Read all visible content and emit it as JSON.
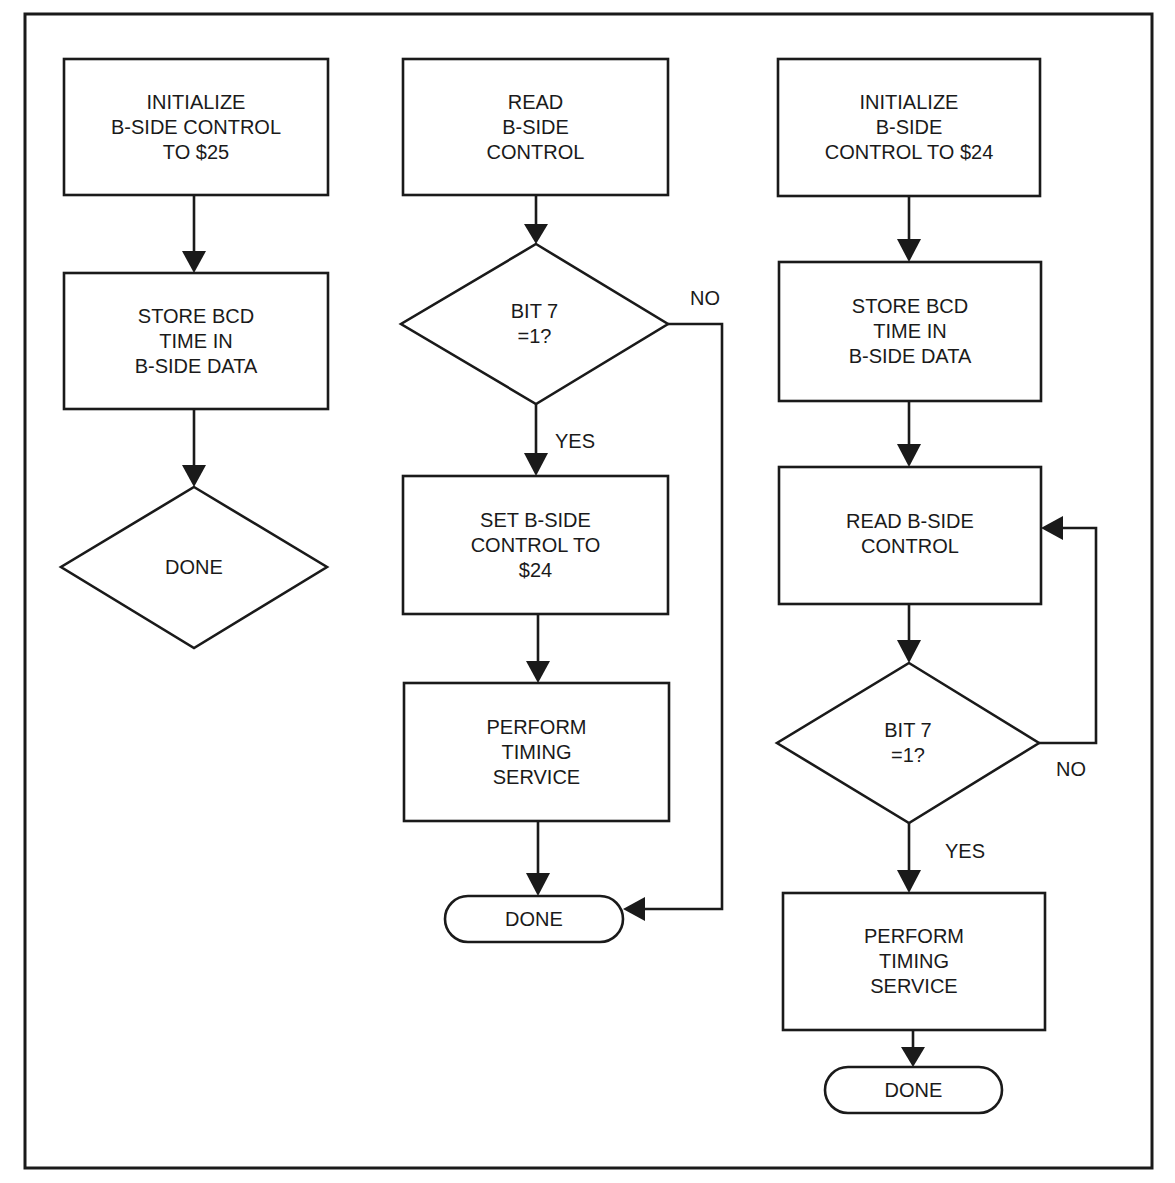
{
  "diagram": {
    "type": "flowchart",
    "columns": [
      {
        "id": "left",
        "nodes": [
          {
            "id": "l1",
            "shape": "rect",
            "text": "INITIALIZE\nB-SIDE CONTROL\nTO $25"
          },
          {
            "id": "l2",
            "shape": "rect",
            "text": "STORE BCD\nTIME IN\nB-SIDE DATA"
          },
          {
            "id": "l3",
            "shape": "diamond",
            "text": "DONE"
          }
        ]
      },
      {
        "id": "middle",
        "nodes": [
          {
            "id": "m1",
            "shape": "rect",
            "text": "READ\nB-SIDE\nCONTROL"
          },
          {
            "id": "m2",
            "shape": "diamond",
            "text": "BIT 7\n=1?"
          },
          {
            "id": "m3",
            "shape": "rect",
            "text": "SET B-SIDE\nCONTROL TO\n$24"
          },
          {
            "id": "m4",
            "shape": "rect",
            "text": "PERFORM\nTIMING\nSERVICE"
          },
          {
            "id": "m5",
            "shape": "terminator",
            "text": "DONE"
          }
        ],
        "branches": {
          "yes": "YES",
          "no": "NO"
        }
      },
      {
        "id": "right",
        "nodes": [
          {
            "id": "r1",
            "shape": "rect",
            "text": "INITIALIZE\nB-SIDE\nCONTROL TO $24"
          },
          {
            "id": "r2",
            "shape": "rect",
            "text": "STORE BCD\nTIME IN\nB-SIDE DATA"
          },
          {
            "id": "r3",
            "shape": "rect",
            "text": "READ B-SIDE\nCONTROL"
          },
          {
            "id": "r4",
            "shape": "diamond",
            "text": "BIT 7\n=1?"
          },
          {
            "id": "r5",
            "shape": "rect",
            "text": "PERFORM\nTIMING\nSERVICE"
          },
          {
            "id": "r6",
            "shape": "terminator",
            "text": "DONE"
          }
        ],
        "branches": {
          "yes": "YES",
          "no": "NO"
        }
      }
    ],
    "edges": [
      {
        "from": "l1",
        "to": "l2"
      },
      {
        "from": "l2",
        "to": "l3"
      },
      {
        "from": "m1",
        "to": "m2"
      },
      {
        "from": "m2",
        "to": "m3",
        "label": "YES"
      },
      {
        "from": "m2",
        "to": "m5",
        "label": "NO"
      },
      {
        "from": "m3",
        "to": "m4"
      },
      {
        "from": "m4",
        "to": "m5"
      },
      {
        "from": "r1",
        "to": "r2"
      },
      {
        "from": "r2",
        "to": "r3"
      },
      {
        "from": "r3",
        "to": "r4"
      },
      {
        "from": "r4",
        "to": "r5",
        "label": "YES"
      },
      {
        "from": "r4",
        "to": "r3",
        "label": "NO"
      },
      {
        "from": "r5",
        "to": "r6"
      }
    ]
  },
  "labels": {
    "left": {
      "l1": "INITIALIZE\nB-SIDE CONTROL\nTO $25",
      "l2": "STORE BCD\nTIME IN\nB-SIDE DATA",
      "l3": "DONE"
    },
    "middle": {
      "m1": "READ\nB-SIDE\nCONTROL",
      "m2": "BIT 7\n=1?",
      "m3": "SET B-SIDE\nCONTROL TO\n$24",
      "m4": "PERFORM\nTIMING\nSERVICE",
      "m5": "DONE",
      "yes": "YES",
      "no": "NO"
    },
    "right": {
      "r1": "INITIALIZE\nB-SIDE\nCONTROL TO $24",
      "r2": "STORE BCD\nTIME IN\nB-SIDE DATA",
      "r3": "READ B-SIDE\nCONTROL",
      "r4": "BIT 7\n=1?",
      "r5": "PERFORM\nTIMING\nSERVICE",
      "r6": "DONE",
      "yes": "YES",
      "no": "NO"
    }
  },
  "colors": {
    "ink": "#1a1a1a",
    "background": "#ffffff"
  }
}
